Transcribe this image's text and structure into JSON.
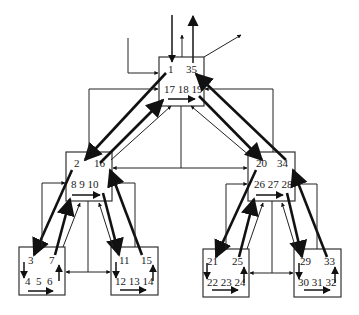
{
  "diagram": {
    "type": "hierarchical flow diagram",
    "nodes": {
      "root": {
        "top_left": "1",
        "top_right": "35",
        "bottom": "17 18 19"
      },
      "mid_left": {
        "top_left": "2",
        "top_right": "16",
        "bottom": "8 9 10"
      },
      "mid_right": {
        "top_left": "20",
        "top_right": "34",
        "bottom": "26 27 28"
      },
      "leaf_ll": {
        "top_left": "3",
        "top_right": "7",
        "bottom": "4  5  6"
      },
      "leaf_lr": {
        "top_left": "11",
        "top_right": "15",
        "bottom": "12 13 14"
      },
      "leaf_rl": {
        "top_left": "21",
        "top_right": "25",
        "bottom": "22 23 24"
      },
      "leaf_rr": {
        "top_left": "29",
        "top_right": "33",
        "bottom": "30 31 32"
      }
    },
    "colors": {
      "stroke": "#222222",
      "background": "#ffffff"
    }
  }
}
